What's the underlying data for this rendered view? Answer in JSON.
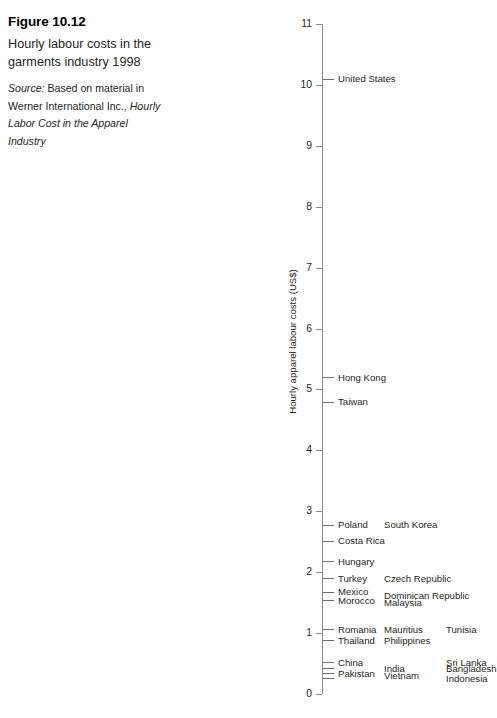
{
  "caption": {
    "figure_number": "Figure 10.12",
    "title": "Hourly labour costs in the garments industry 1998",
    "source_label": "Source:",
    "source_plain_1": " Based on material in Werner International Inc., ",
    "source_italic": "Hourly Labor Cost in the Apparel Industry"
  },
  "chart_data": {
    "type": "scatter",
    "title": "Hourly labour costs in the garments industry 1998",
    "xlabel": "",
    "ylabel": "Hourly apparel labour costs (US$)",
    "ylim": [
      0,
      11
    ],
    "ytick_labels": [
      "0",
      "1",
      "2",
      "3",
      "4",
      "5",
      "6",
      "7",
      "8",
      "9",
      "10",
      "11"
    ],
    "ytick_values": [
      0,
      1,
      2,
      3,
      4,
      5,
      6,
      7,
      8,
      9,
      10,
      11
    ],
    "grid": false,
    "legend": "none",
    "orientation": "vertical-strip",
    "note": "Each country is a horizontal tick mark on a single vertical value axis; labels are laid out in up to three text columns to the right of the axis.",
    "points": [
      {
        "label": "United States",
        "value": 10.1,
        "column": 1
      },
      {
        "label": "Hong Kong",
        "value": 5.2,
        "column": 1
      },
      {
        "label": "Taiwan",
        "value": 4.8,
        "column": 1
      },
      {
        "label": "Poland",
        "value": 2.78,
        "column": 1
      },
      {
        "label": "South Korea",
        "value": 2.78,
        "column": 2
      },
      {
        "label": "Costa Rica",
        "value": 2.52,
        "column": 1
      },
      {
        "label": "Hungary",
        "value": 2.18,
        "column": 1
      },
      {
        "label": "Turkey",
        "value": 1.9,
        "column": 1
      },
      {
        "label": "Czech Republic",
        "value": 1.9,
        "column": 2
      },
      {
        "label": "Mexico",
        "value": 1.68,
        "column": 1
      },
      {
        "label": "Dominican Republic",
        "value": 1.62,
        "column": 2
      },
      {
        "label": "Morocco",
        "value": 1.54,
        "column": 1
      },
      {
        "label": "Malaysia",
        "value": 1.5,
        "column": 2
      },
      {
        "label": "Romania",
        "value": 1.06,
        "column": 1
      },
      {
        "label": "Mauritius",
        "value": 1.06,
        "column": 2
      },
      {
        "label": "Tunisia",
        "value": 1.06,
        "column": 3
      },
      {
        "label": "Thailand",
        "value": 0.88,
        "column": 1
      },
      {
        "label": "Philippines",
        "value": 0.88,
        "column": 2
      },
      {
        "label": "China",
        "value": 0.52,
        "column": 1
      },
      {
        "label": "Sri Lanka",
        "value": 0.52,
        "column": 3
      },
      {
        "label": "India",
        "value": 0.42,
        "column": 2
      },
      {
        "label": "Bangladesh",
        "value": 0.42,
        "column": 3
      },
      {
        "label": "Pakistan",
        "value": 0.34,
        "column": 1
      },
      {
        "label": "Vietnam",
        "value": 0.3,
        "column": 2
      },
      {
        "label": "Indonesia",
        "value": 0.26,
        "column": 3
      }
    ],
    "tick_marks": [
      10.1,
      5.2,
      4.8,
      2.78,
      2.52,
      2.18,
      1.9,
      1.68,
      1.54,
      1.06,
      0.88,
      0.52,
      0.42,
      0.34,
      0.26
    ]
  },
  "colors": {
    "text": "#231f20",
    "axis": "#8a8a8a",
    "tick": "#6f6f6f",
    "background": "#ffffff"
  }
}
